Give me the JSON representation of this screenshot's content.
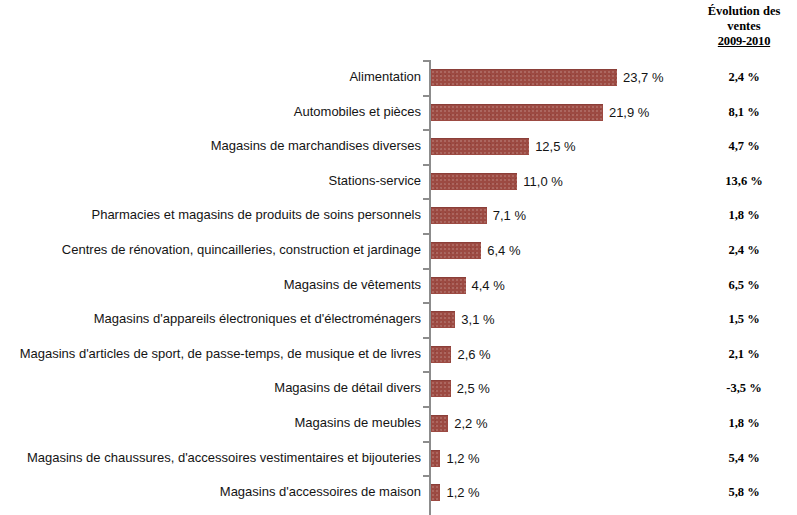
{
  "evolution_column": {
    "line1": "Évolution des",
    "line2": "ventes",
    "years": "2009-2010"
  },
  "chart_data": {
    "type": "bar",
    "orientation": "horizontal",
    "title": "",
    "xlabel": "",
    "ylabel": "",
    "xlim": [
      0,
      25
    ],
    "grid": false,
    "legend": null,
    "bar_color": "#9c4a42",
    "categories": [
      "Alimentation",
      "Automobiles et pièces",
      "Magasins de marchandises diverses",
      "Stations-service",
      "Pharmacies et magasins de produits de soins personnels",
      "Centres de rénovation, quincailleries, construction et jardinage",
      "Magasins de vêtements",
      "Magasins d'appareils électroniques et d'électroménagers",
      "Magasins d'articles de sport, de passe-temps, de musique et de livres",
      "Magasins de détail divers",
      "Magasins de meubles",
      "Magasins de chaussures, d'accessoires vestimentaires et bijouteries",
      "Magasins d'accessoires de maison"
    ],
    "values": [
      23.7,
      21.9,
      12.5,
      11.0,
      7.1,
      6.4,
      4.4,
      3.1,
      2.6,
      2.5,
      2.2,
      1.2,
      1.2
    ],
    "value_labels": [
      "23,7 %",
      "21,9 %",
      "12,5 %",
      "11,0 %",
      "7,1 %",
      "6,4 %",
      "4,4 %",
      "3,1 %",
      "2,6 %",
      "2,5 %",
      "2,2 %",
      "1,2 %",
      "1,2 %"
    ],
    "series": [
      {
        "name": "Part des ventes",
        "values": [
          23.7,
          21.9,
          12.5,
          11.0,
          7.1,
          6.4,
          4.4,
          3.1,
          2.6,
          2.5,
          2.2,
          1.2,
          1.2
        ]
      },
      {
        "name": "Évolution des ventes 2009-2010",
        "values": [
          2.4,
          8.1,
          4.7,
          13.6,
          1.8,
          2.4,
          6.5,
          1.5,
          2.1,
          -3.5,
          1.8,
          5.4,
          5.8
        ],
        "labels": [
          "2,4 %",
          "8,1 %",
          "4,7 %",
          "13,6 %",
          "1,8 %",
          "2,4 %",
          "6,5 %",
          "1,5 %",
          "2,1 %",
          "-3,5 %",
          "1,8 %",
          "5,4 %",
          "5,8 %"
        ]
      }
    ]
  }
}
